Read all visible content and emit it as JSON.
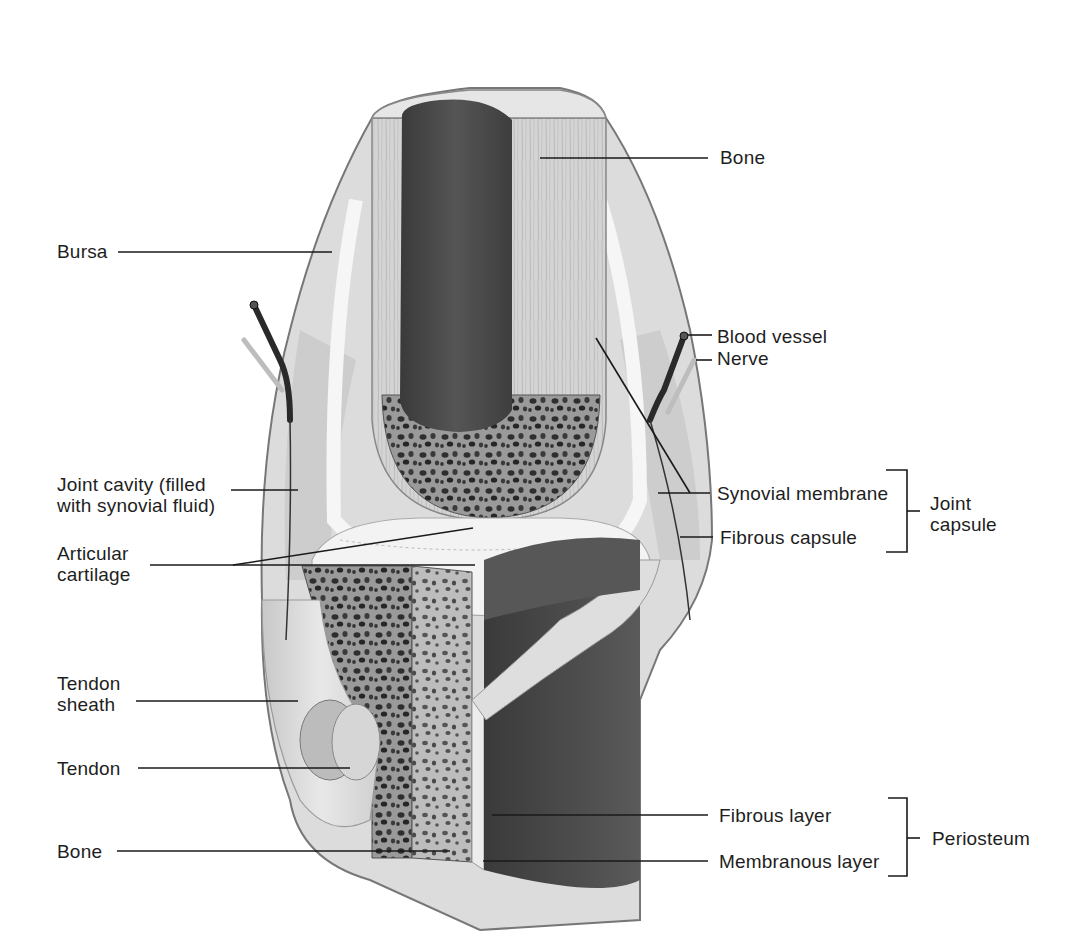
{
  "diagram": {
    "labels": {
      "bone_top": "Bone",
      "bursa": "Bursa",
      "blood_vessel": "Blood vessel",
      "nerve": "Nerve",
      "joint_cavity_line1": "Joint cavity (filled",
      "joint_cavity_line2": "with synovial fluid)",
      "articular_cartilage_line1": "Articular",
      "articular_cartilage_line2": "cartilage",
      "synovial_membrane": "Synovial membrane",
      "fibrous_capsule": "Fibrous capsule",
      "joint_capsule_line1": "Joint",
      "joint_capsule_line2": "capsule",
      "tendon_sheath_line1": "Tendon",
      "tendon_sheath_line2": "sheath",
      "tendon": "Tendon",
      "bone_bottom": "Bone",
      "fibrous_layer": "Fibrous layer",
      "membranous_layer": "Membranous layer",
      "periosteum": "Periosteum"
    },
    "groups": [
      {
        "name": "Joint capsule",
        "members": [
          "Synovial membrane",
          "Fibrous capsule"
        ]
      },
      {
        "name": "Periosteum",
        "members": [
          "Fibrous layer",
          "Membranous layer"
        ]
      }
    ],
    "colors": {
      "background": "#ffffff",
      "line": "#1a1a1a",
      "text": "#1e1e1e",
      "bone_light": "#d9d9d9",
      "marrow_dark": "#4a4a4a",
      "cartilage": "#f2f2f2",
      "cavity": "#cfcfcf",
      "bone_section_dark": "#3c3c3c"
    }
  }
}
